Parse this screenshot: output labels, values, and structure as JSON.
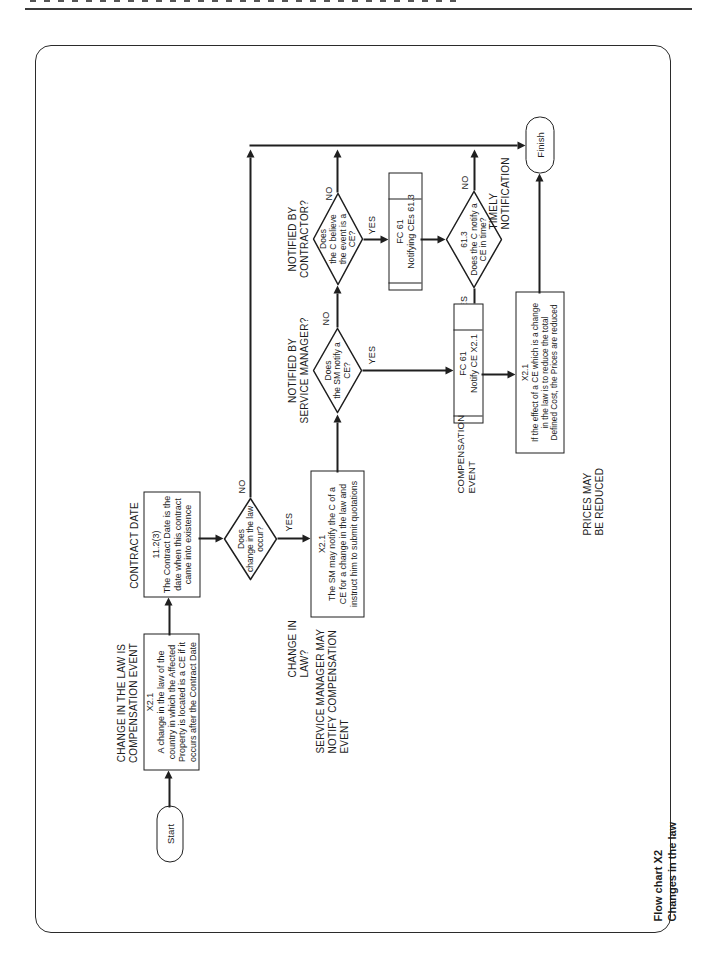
{
  "flowchart": {
    "start": {
      "label": "Start"
    },
    "change_in_law_event": {
      "text": [
        "X2.1",
        "A change in the law of the",
        "country in which the Affected",
        "Property is located is a CE if it",
        "occurs after the Contract Date"
      ],
      "caption": [
        "CHANGE IN THE LAW IS",
        "COMPENSATION EVENT"
      ]
    },
    "contract_date": {
      "text": [
        "11.2(3)",
        "The Contract Date is the",
        "date when this contract",
        "came into existence"
      ],
      "caption": [
        "CONTRACT DATE"
      ]
    },
    "change_occur_decision": {
      "text": [
        "Does",
        "change in the law",
        "occur?"
      ],
      "caption": [
        "CHANGE IN",
        "LAW?"
      ]
    },
    "sm_notify_box": {
      "text": [
        "X2.1",
        "The SM may notify the C of a",
        "CE for a change in the law and",
        "instruct him to submit quotations"
      ],
      "caption": [
        "SERVICE MANAGER MAY",
        "NOTIFY COMPENSATION",
        "EVENT"
      ]
    },
    "sm_notify_decision": {
      "text": [
        "Does",
        "the SM notify a",
        "CE?"
      ],
      "caption": [
        "NOTIFIED BY",
        "SERVICE MANAGER?"
      ]
    },
    "contractor_believe_decision": {
      "text": [
        "Does",
        "the C believe",
        "the event is a",
        "CE?"
      ],
      "caption": [
        "NOTIFIED BY",
        "CONTRACTOR?"
      ]
    },
    "notifying_ces": {
      "text": [
        "FC 61",
        "Notifying CEs 61.3"
      ]
    },
    "timely_decision": {
      "text": [
        "61.3",
        "Does the C notify a",
        "CE in time?"
      ],
      "caption": [
        "TIMELY",
        "NOTIFICATION"
      ]
    },
    "notify_ce": {
      "text": [
        "FC 61",
        "Notify CE X2.1"
      ],
      "caption": [
        "COMPENSATION",
        "EVENT"
      ]
    },
    "prices_reduced": {
      "text": [
        "X2.1",
        "If the effect of a CE which is a change",
        "in the law is to reduce the total",
        "Defined Cost, the Prices are reduced"
      ],
      "caption": [
        "PRICES MAY",
        "BE REDUCED"
      ]
    },
    "finish": {
      "label": "Finish"
    },
    "labels": {
      "yes": "YES",
      "no": "NO"
    }
  },
  "footer": {
    "title": [
      "Flow chart X2",
      "Changes in the law"
    ]
  }
}
